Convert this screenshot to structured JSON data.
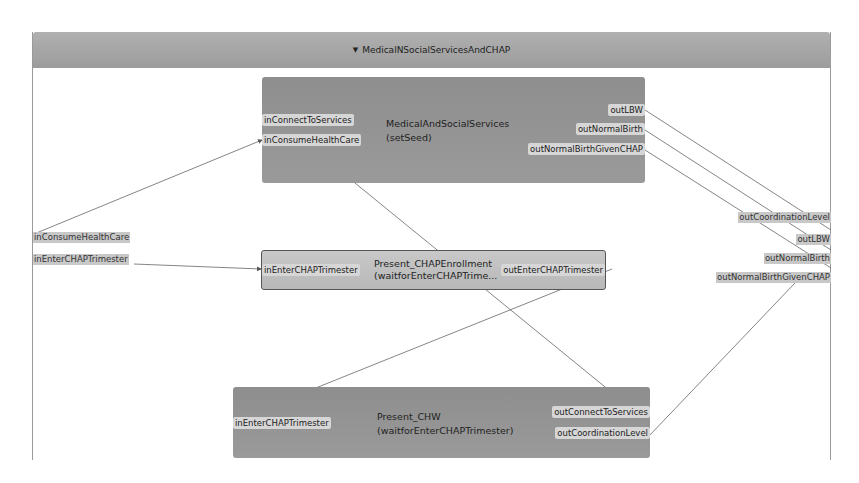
{
  "diagram": {
    "title": "MedicalNSocialServicesAndCHAP",
    "collapse_icon": "triangle-down-icon",
    "external_inputs": [
      {
        "label": "inConsumeHealthCare"
      },
      {
        "label": "inEnterCHAPTrimester"
      }
    ],
    "external_outputs": [
      {
        "label": "outCoordinationLevel"
      },
      {
        "label": "outLBW"
      },
      {
        "label": "outNormalBirth"
      },
      {
        "label": "outNormalBirthGivenCHAP"
      }
    ],
    "blocks": [
      {
        "name": "MedicalAndSocialServices",
        "subtitle": "(setSeed)",
        "inputs": [
          "inConnectToServices",
          "inConsumeHealthCare"
        ],
        "outputs": [
          "outLBW",
          "outNormalBirth",
          "outNormalBirthGivenCHAP"
        ]
      },
      {
        "name": "Present_CHAPEnrollment",
        "subtitle": "(waitforEnterCHAPTrime...",
        "inputs": [
          "inEnterCHAPTrimester"
        ],
        "outputs": [
          "outEnterCHAPTrimester"
        ]
      },
      {
        "name": "Present_CHW",
        "subtitle": "(waitforEnterCHAPTrimester)",
        "inputs": [
          "inEnterCHAPTrimester"
        ],
        "outputs": [
          "outConnectToServices",
          "outCoordinationLevel"
        ]
      }
    ]
  }
}
